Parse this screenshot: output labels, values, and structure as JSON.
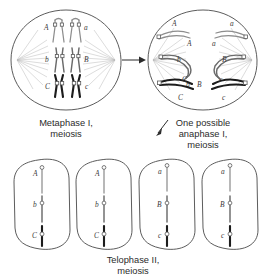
{
  "figure": {
    "background_color": "#ffffff",
    "line_color": "#4a4a4a"
  },
  "panels": {
    "metaphase": {
      "caption_line1": "Metaphase I,",
      "caption_line2": "meiosis",
      "chromosome_pairs": [
        {
          "row": "top",
          "left_label": "A",
          "right_label": "a",
          "shade": "light"
        },
        {
          "row": "middle",
          "left_label": "b",
          "right_label": "B",
          "shade": "mid"
        },
        {
          "row": "bottom",
          "left_label": "C",
          "right_label": "c",
          "shade": "dark"
        }
      ]
    },
    "anaphase": {
      "caption_line1": "One possible",
      "caption_line2": "anaphase I,",
      "caption_line3": "meiosis",
      "chromosome_groups": [
        {
          "row": "top",
          "left_labels": [
            "A",
            "A"
          ],
          "right_labels": [
            "a",
            "a"
          ],
          "shade": "light"
        },
        {
          "row": "middle",
          "left_labels": [
            "b",
            "b"
          ],
          "right_labels": [
            "B",
            "B"
          ],
          "shade": "mid"
        },
        {
          "row": "bottom",
          "left_labels": [
            "C",
            "C"
          ],
          "right_labels": [
            "c",
            "c"
          ],
          "shade": "dark"
        }
      ]
    },
    "telophase": {
      "caption_line1": "Telophase II,",
      "caption_line2": "meiosis",
      "cells": [
        {
          "labels": [
            "A",
            "b",
            "C"
          ]
        },
        {
          "labels": [
            "A",
            "b",
            "C"
          ]
        },
        {
          "labels": [
            "a",
            "B",
            "c"
          ]
        },
        {
          "labels": [
            "a",
            "B",
            "c"
          ]
        }
      ]
    }
  },
  "arrows": {
    "metaphase_to_anaphase": "horizontal-right-arrow",
    "anaphase_to_telophase": "diagonal-down-left-arrow"
  }
}
